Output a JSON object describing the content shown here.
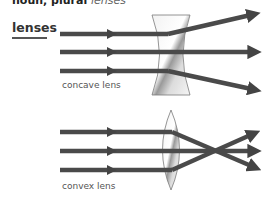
{
  "entry": {
    "headword_line": "noun, plural",
    "plural_form": "lenses"
  },
  "heading": "lenses",
  "diagrams": [
    {
      "name": "concave lens",
      "caption": "concave lens",
      "lens_type": "concave",
      "rays": [
        "top ray diverges upward",
        "middle ray passes straight",
        "bottom ray diverges downward"
      ]
    },
    {
      "name": "convex lens",
      "caption": "convex lens",
      "lens_type": "convex",
      "rays": [
        "top ray converges downward",
        "middle ray passes straight",
        "bottom ray converges upward"
      ]
    }
  ],
  "colors": {
    "ray": "#4a4a4a",
    "lens_fill": "#e6e6e6",
    "lens_stroke": "#7a7a7a",
    "text": "#333333"
  }
}
